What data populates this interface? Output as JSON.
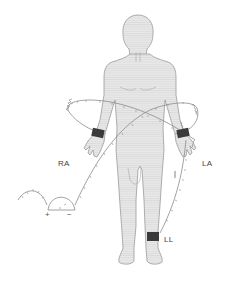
{
  "figure": {
    "electrodes": [
      {
        "id": "RA",
        "label": "RA"
      },
      {
        "id": "LA",
        "label": "LA"
      },
      {
        "id": "LL",
        "label": "LL"
      }
    ],
    "galvanometer": {
      "positive_label": "+",
      "negative_label": "−"
    },
    "colors": {
      "body_fill": "#e6e6e6",
      "body_stroke": "#9a9a9a",
      "electrode_band": "#3a3a3a",
      "wire": "#8a8a8a",
      "label_text": "#444444"
    }
  }
}
